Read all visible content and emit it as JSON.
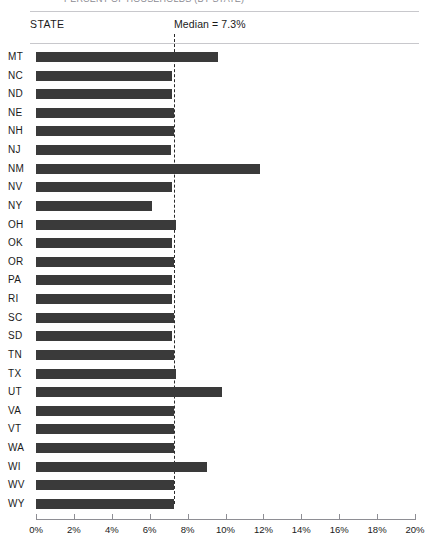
{
  "supertitle": "PERCENT OF HOUSEHOLDS (BY STATE)",
  "header": {
    "state_label": "STATE",
    "median_label": "Median = 7.3%"
  },
  "chart_data": {
    "type": "bar",
    "orientation": "horizontal",
    "title": "",
    "xlabel": "",
    "ylabel": "STATE",
    "xlim": [
      0,
      20
    ],
    "xticks": [
      0,
      2,
      4,
      6,
      8,
      10,
      12,
      14,
      16,
      18,
      20
    ],
    "xtick_labels": [
      "0%",
      "2%",
      "4%",
      "6%",
      "8%",
      "10%",
      "12%",
      "14%",
      "16%",
      "18%",
      "20%"
    ],
    "grid": false,
    "legend": "none",
    "bar_color": "#3a3a3a",
    "annotations": [
      {
        "name": "median-line",
        "label": "Median = 7.3%",
        "value": 7.3,
        "style": "dashed-vertical"
      }
    ],
    "categories": [
      "MT",
      "NC",
      "ND",
      "NE",
      "NH",
      "NJ",
      "NM",
      "NV",
      "NY",
      "OH",
      "OK",
      "OR",
      "PA",
      "RI",
      "SC",
      "SD",
      "TN",
      "TX",
      "UT",
      "VA",
      "VT",
      "WA",
      "WI",
      "WV",
      "WY"
    ],
    "values": [
      9.6,
      7.2,
      7.2,
      7.3,
      7.3,
      7.1,
      11.8,
      7.2,
      6.1,
      7.4,
      7.2,
      7.3,
      7.2,
      7.2,
      7.3,
      7.2,
      7.3,
      7.4,
      9.8,
      7.3,
      7.3,
      7.3,
      9.0,
      7.3,
      7.3
    ]
  },
  "colors": {
    "bar": "#3a3a3a",
    "rule": "#c8c8cc",
    "axis": "#8e8e94",
    "text": "#1a1a1a"
  }
}
